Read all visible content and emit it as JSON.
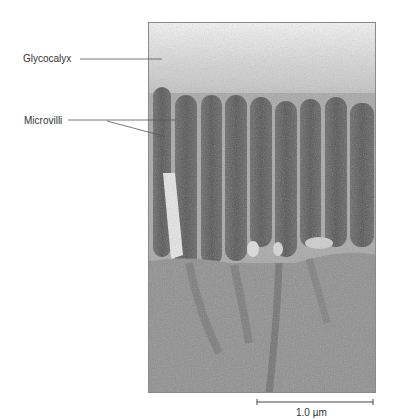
{
  "figure": {
    "labels": [
      {
        "text": "Glycocalyx",
        "target": "glycocalyx"
      },
      {
        "text": "Microvilli",
        "target": "microvilli"
      }
    ],
    "scale_bar": {
      "label": "1.0 µm"
    }
  },
  "colors": {
    "background": "#ffffff",
    "label_text": "#333333",
    "leader_line": "#555555",
    "glycocalyx_top": "#f2f2f2",
    "microvillus_core": "#5e5e5e",
    "cytoplasm": "#8e8e8e"
  }
}
